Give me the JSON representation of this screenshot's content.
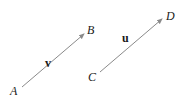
{
  "diagram": {
    "type": "vectors",
    "arrow_color": "#8a8a8a",
    "text_color": "#1a1a1a",
    "vectors": [
      {
        "name": "v",
        "from": {
          "label": "A",
          "x": 22,
          "y": 87
        },
        "to": {
          "label": "B",
          "x": 84,
          "y": 34
        },
        "label_pos": {
          "x": 45,
          "y": 67
        }
      },
      {
        "name": "u",
        "from": {
          "label": "C",
          "x": 100,
          "y": 72
        },
        "to": {
          "label": "D",
          "x": 162,
          "y": 19
        },
        "label_pos": {
          "x": 122,
          "y": 42
        }
      }
    ],
    "point_labels": [
      {
        "text": "A",
        "x": 10,
        "y": 95
      },
      {
        "text": "B",
        "x": 87,
        "y": 34
      },
      {
        "text": "C",
        "x": 88,
        "y": 81
      },
      {
        "text": "D",
        "x": 166,
        "y": 20
      }
    ]
  }
}
